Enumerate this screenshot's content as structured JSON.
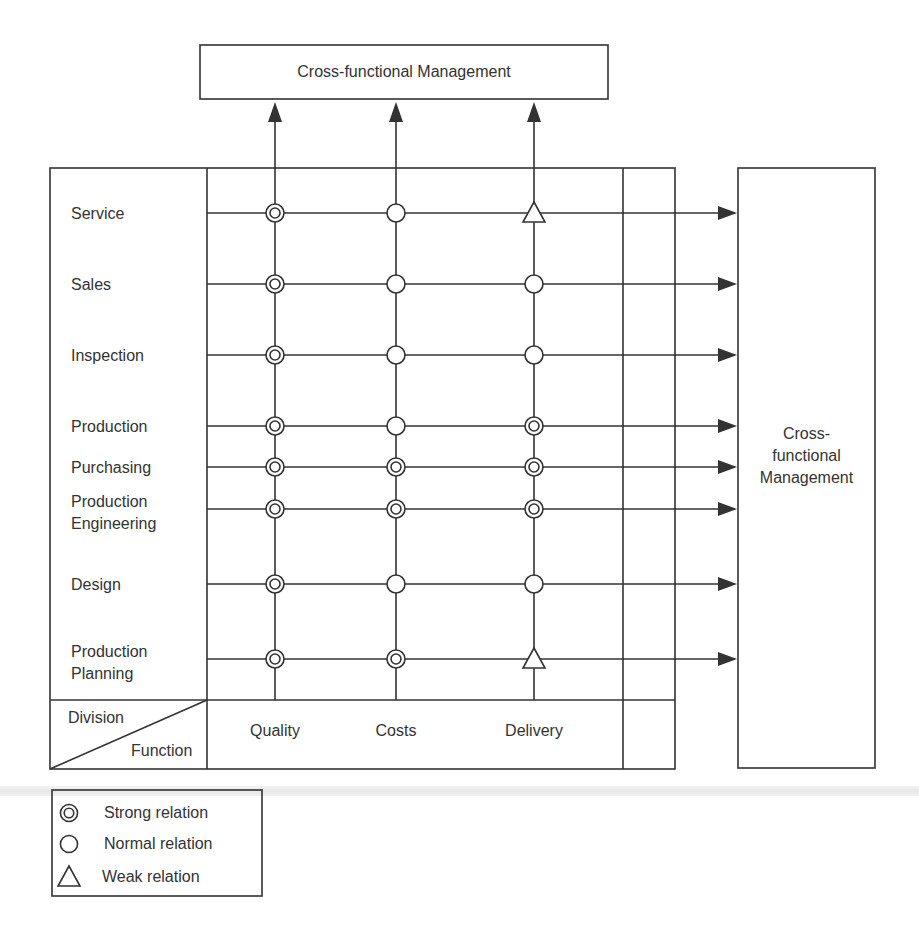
{
  "top_box": {
    "label": "Cross-functional Management"
  },
  "right_box": {
    "label_lines": [
      "Cross-",
      "functional",
      "Management"
    ]
  },
  "corner_header": {
    "division_label": "Division",
    "function_label": "Function"
  },
  "columns": [
    {
      "label": "Quality"
    },
    {
      "label": "Costs"
    },
    {
      "label": "Delivery"
    }
  ],
  "rows": [
    {
      "label_lines": [
        "Service"
      ],
      "relations": [
        "strong",
        "normal",
        "weak"
      ]
    },
    {
      "label_lines": [
        "Sales"
      ],
      "relations": [
        "strong",
        "normal",
        "normal"
      ]
    },
    {
      "label_lines": [
        "Inspection"
      ],
      "relations": [
        "strong",
        "normal",
        "normal"
      ]
    },
    {
      "label_lines": [
        "Production"
      ],
      "relations": [
        "strong",
        "normal",
        "strong"
      ]
    },
    {
      "label_lines": [
        "Purchasing"
      ],
      "relations": [
        "strong",
        "strong",
        "strong"
      ]
    },
    {
      "label_lines": [
        "Production",
        "Engineering"
      ],
      "relations": [
        "strong",
        "strong",
        "strong"
      ]
    },
    {
      "label_lines": [
        "Design"
      ],
      "relations": [
        "strong",
        "normal",
        "normal"
      ]
    },
    {
      "label_lines": [
        "Production",
        "Planning"
      ],
      "relations": [
        "strong",
        "strong",
        "weak"
      ]
    }
  ],
  "legend": {
    "items": [
      {
        "symbol": "strong",
        "label": "Strong relation"
      },
      {
        "symbol": "normal",
        "label": "Normal relation"
      },
      {
        "symbol": "weak",
        "label": "Weak relation"
      }
    ]
  },
  "colors": {
    "line": "#333333",
    "background": "#ffffff"
  }
}
